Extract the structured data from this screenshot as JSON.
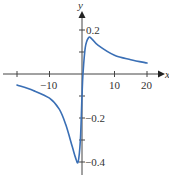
{
  "chart_data": {
    "type": "line",
    "title": "",
    "xlabel": "x",
    "ylabel": "y",
    "xlim": [
      -24,
      25
    ],
    "ylim": [
      -0.45,
      0.33
    ],
    "grid": false,
    "legend": null,
    "x_ticks": [
      -20,
      -10,
      0,
      10,
      20
    ],
    "x_tick_labels": [
      "",
      "−10",
      "",
      "10",
      "20"
    ],
    "y_ticks": [
      0.2,
      0.1,
      -0.1,
      -0.2,
      -0.3,
      -0.4
    ],
    "y_tick_labels": [
      "0.2",
      "",
      "",
      "−0.2",
      "",
      "−0.4"
    ],
    "series": [
      {
        "name": "f(x)",
        "color": "#3a6fb5",
        "x": [
          -20,
          -15,
          -10,
          -7,
          -5,
          -3,
          -2,
          -1.2,
          -0.5,
          0,
          0.3,
          1,
          2,
          3,
          5,
          10,
          15,
          20
        ],
        "y": [
          -0.05,
          -0.075,
          -0.11,
          -0.16,
          -0.23,
          -0.33,
          -0.38,
          -0.4,
          -0.3,
          -0.1,
          0.0,
          0.12,
          0.165,
          0.16,
          0.13,
          0.085,
          0.065,
          0.05
        ]
      }
    ]
  },
  "labels": {
    "x_axis": "x",
    "y_axis": "y",
    "xt_m10": "−10",
    "xt_10": "10",
    "xt_20": "20",
    "yt_02": "0.2",
    "yt_m02": "−0.2",
    "yt_m04": "−0.4"
  }
}
